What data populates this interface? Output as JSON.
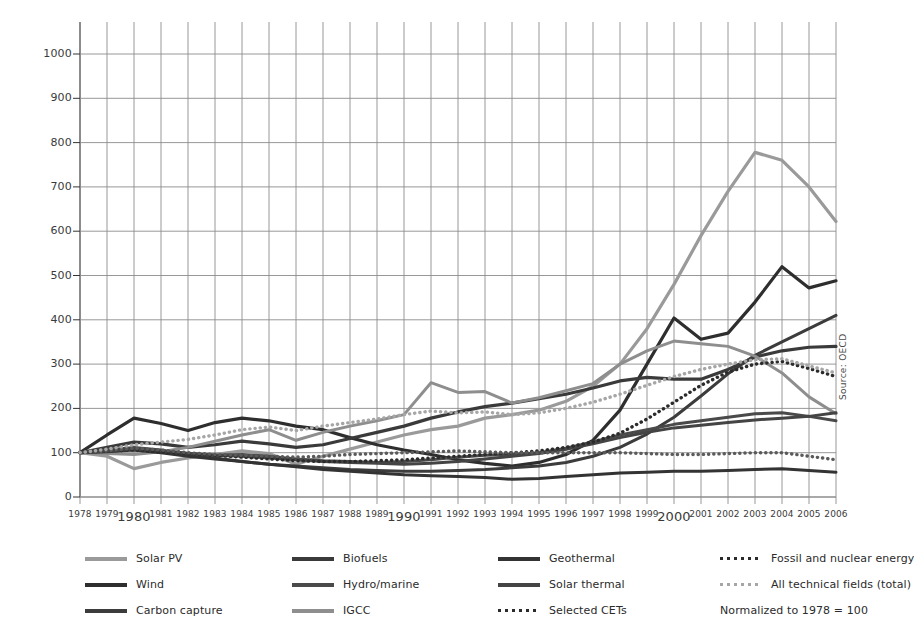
{
  "chart_data": {
    "type": "line",
    "title": "",
    "xlabel": "",
    "ylabel": "",
    "normalization_note": "Normalized to 1978 = 100",
    "source": "Source: OECD",
    "grid": true,
    "legend_position": "bottom",
    "xlim": [
      1978,
      2006
    ],
    "ylim": [
      0,
      1000
    ],
    "ytick_labels": [
      "0",
      "100",
      "200",
      "300",
      "400",
      "500",
      "600",
      "700",
      "800",
      "900",
      "1000"
    ],
    "yticks": [
      0,
      100,
      200,
      300,
      400,
      500,
      600,
      700,
      800,
      900,
      1000
    ],
    "x": [
      1978,
      1979,
      1980,
      1981,
      1982,
      1983,
      1984,
      1985,
      1986,
      1987,
      1988,
      1989,
      1990,
      1991,
      1992,
      1993,
      1994,
      1995,
      1996,
      1997,
      1998,
      1999,
      2000,
      2001,
      2002,
      2003,
      2004,
      2005,
      2006
    ],
    "xtick_labels": [
      "1978",
      "1979",
      "1980",
      "1981",
      "1982",
      "1983",
      "1984",
      "1985",
      "1986",
      "1987",
      "1988",
      "1989",
      "1990",
      "1991",
      "1992",
      "1993",
      "1994",
      "1995",
      "1996",
      "1997",
      "1998",
      "1999",
      "2000",
      "2001",
      "2002",
      "2003",
      "2004",
      "2005",
      "2006"
    ],
    "emphasized_xticks": [
      "1980",
      "1990",
      "2000"
    ],
    "series": [
      {
        "name": "Solar PV",
        "color": "#9a9a9a",
        "style": "solid",
        "width": 3.2,
        "values": [
          100,
          92,
          64,
          78,
          88,
          96,
          104,
          98,
          74,
          92,
          108,
          124,
          140,
          152,
          160,
          178,
          186,
          196,
          216,
          250,
          300,
          380,
          480,
          590,
          690,
          778,
          760,
          700,
          622
        ]
      },
      {
        "name": "Wind",
        "color": "#2e2e2e",
        "style": "solid",
        "width": 3.2,
        "values": [
          100,
          140,
          178,
          166,
          150,
          168,
          178,
          172,
          160,
          152,
          134,
          118,
          106,
          96,
          84,
          76,
          70,
          78,
          96,
          128,
          196,
          300,
          404,
          356,
          370,
          440,
          520,
          472,
          488
        ]
      },
      {
        "name": "Carbon capture",
        "color": "#3c3c3c",
        "style": "solid",
        "width": 3.0,
        "values": [
          100,
          104,
          110,
          104,
          96,
          88,
          80,
          74,
          70,
          66,
          62,
          60,
          58,
          58,
          60,
          62,
          66,
          70,
          78,
          92,
          112,
          142,
          180,
          228,
          278,
          320,
          350,
          380,
          410
        ]
      },
      {
        "name": "Biofuels",
        "color": "#3a3a3a",
        "style": "solid",
        "width": 3.2,
        "values": [
          100,
          112,
          124,
          120,
          112,
          118,
          126,
          120,
          112,
          118,
          132,
          146,
          160,
          178,
          192,
          204,
          212,
          222,
          232,
          246,
          262,
          270,
          266,
          266,
          288,
          316,
          330,
          338,
          340
        ]
      },
      {
        "name": "Hydro/marine",
        "color": "#4a4a4a",
        "style": "solid",
        "width": 3.0,
        "values": [
          100,
          106,
          112,
          106,
          98,
          94,
          96,
          92,
          86,
          82,
          80,
          78,
          80,
          84,
          90,
          94,
          96,
          100,
          110,
          124,
          140,
          152,
          164,
          172,
          180,
          188,
          190,
          182,
          172
        ]
      },
      {
        "name": "IGCC",
        "color": "#8e8e8e",
        "style": "solid",
        "width": 3.0,
        "values": [
          100,
          98,
          96,
          102,
          112,
          126,
          140,
          152,
          128,
          146,
          160,
          172,
          186,
          258,
          236,
          238,
          212,
          224,
          240,
          256,
          300,
          330,
          352,
          346,
          340,
          318,
          280,
          226,
          188
        ]
      },
      {
        "name": "Geothermal",
        "color": "#333333",
        "style": "solid",
        "width": 3.0,
        "values": [
          100,
          102,
          106,
          100,
          92,
          86,
          80,
          74,
          68,
          62,
          58,
          54,
          50,
          48,
          46,
          44,
          40,
          42,
          46,
          50,
          54,
          56,
          58,
          58,
          60,
          62,
          64,
          60,
          56
        ]
      },
      {
        "name": "Solar thermal",
        "color": "#444444",
        "style": "solid",
        "width": 3.0,
        "values": [
          100,
          104,
          108,
          104,
          98,
          94,
          92,
          88,
          84,
          80,
          78,
          76,
          74,
          76,
          80,
          86,
          92,
          98,
          108,
          120,
          134,
          146,
          156,
          162,
          168,
          174,
          178,
          182,
          190
        ]
      },
      {
        "name": "Selected CETs",
        "color": "#2b2b2b",
        "style": "dotted",
        "width": 3.4,
        "values": [
          100,
          104,
          106,
          102,
          98,
          94,
          90,
          86,
          82,
          80,
          80,
          82,
          84,
          88,
          92,
          96,
          100,
          104,
          112,
          124,
          144,
          176,
          214,
          252,
          282,
          300,
          306,
          290,
          272
        ]
      },
      {
        "name": "Fossil and nuclear energy",
        "color": "#5a5a5a",
        "style": "dotted",
        "width": 3.4,
        "values": [
          100,
          104,
          110,
          106,
          100,
          96,
          94,
          92,
          90,
          92,
          96,
          98,
          100,
          102,
          104,
          102,
          100,
          100,
          100,
          100,
          100,
          98,
          96,
          96,
          98,
          100,
          100,
          92,
          84
        ]
      },
      {
        "name": "All technical fields (total)",
        "color": "#a6a6a6",
        "style": "dotted",
        "width": 3.4,
        "values": [
          100,
          108,
          118,
          124,
          130,
          140,
          152,
          158,
          150,
          160,
          168,
          176,
          186,
          194,
          190,
          192,
          186,
          190,
          200,
          214,
          232,
          252,
          272,
          288,
          300,
          310,
          312,
          296,
          280
        ]
      }
    ]
  },
  "legend": {
    "items": [
      {
        "label": "Solar PV",
        "color": "#9a9a9a",
        "style": "solid",
        "icon": "line-swatch-icon"
      },
      {
        "label": "Biofuels",
        "color": "#3a3a3a",
        "style": "solid",
        "icon": "line-swatch-icon"
      },
      {
        "label": "Geothermal",
        "color": "#333333",
        "style": "solid",
        "icon": "line-swatch-icon"
      },
      {
        "label": "Fossil and nuclear energy",
        "color": "#2b2b2b",
        "style": "dotted",
        "icon": "dotted-line-swatch-icon"
      },
      {
        "label": "Wind",
        "color": "#2e2e2e",
        "style": "solid",
        "icon": "line-swatch-icon"
      },
      {
        "label": "Hydro/marine",
        "color": "#4a4a4a",
        "style": "solid",
        "icon": "line-swatch-icon"
      },
      {
        "label": "Solar thermal",
        "color": "#444444",
        "style": "solid",
        "icon": "line-swatch-icon"
      },
      {
        "label": "All technical fields (total)",
        "color": "#a6a6a6",
        "style": "dotted",
        "icon": "dotted-line-swatch-icon"
      },
      {
        "label": "Carbon capture",
        "color": "#3c3c3c",
        "style": "solid",
        "icon": "line-swatch-icon"
      },
      {
        "label": "IGCC",
        "color": "#8e8e8e",
        "style": "solid",
        "icon": "line-swatch-icon"
      },
      {
        "label": "Selected CETs",
        "color": "#2b2b2b",
        "style": "dotted",
        "icon": "dotted-line-swatch-icon"
      }
    ],
    "note": "Normalized to 1978 = 100"
  },
  "source_note": "Source: OECD",
  "colors": {
    "grid": "#8c8c8c",
    "axis": "#333333",
    "background": "#ffffff",
    "text": "#2b2b2b"
  }
}
